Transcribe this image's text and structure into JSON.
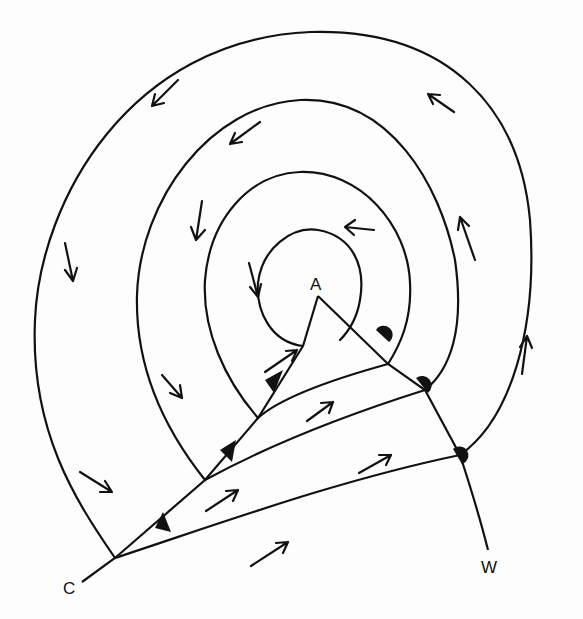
{
  "diagram": {
    "type": "weather-map-occluded-depression",
    "labels": {
      "center": "A",
      "cold_front_end": "C",
      "warm_front_end": "W"
    },
    "isobar_count": 4,
    "fronts": [
      {
        "name": "occluded-front",
        "from": "A",
        "symbols": "none"
      },
      {
        "name": "cold-front",
        "to": "C",
        "symbols": "triangles",
        "count": 3
      },
      {
        "name": "warm-front",
        "to": "W",
        "symbols": "semicircles",
        "count": 3
      }
    ],
    "wind_arrow_count": 16,
    "colors": {
      "ink": "#111111",
      "background": "#fdfdfd"
    }
  }
}
